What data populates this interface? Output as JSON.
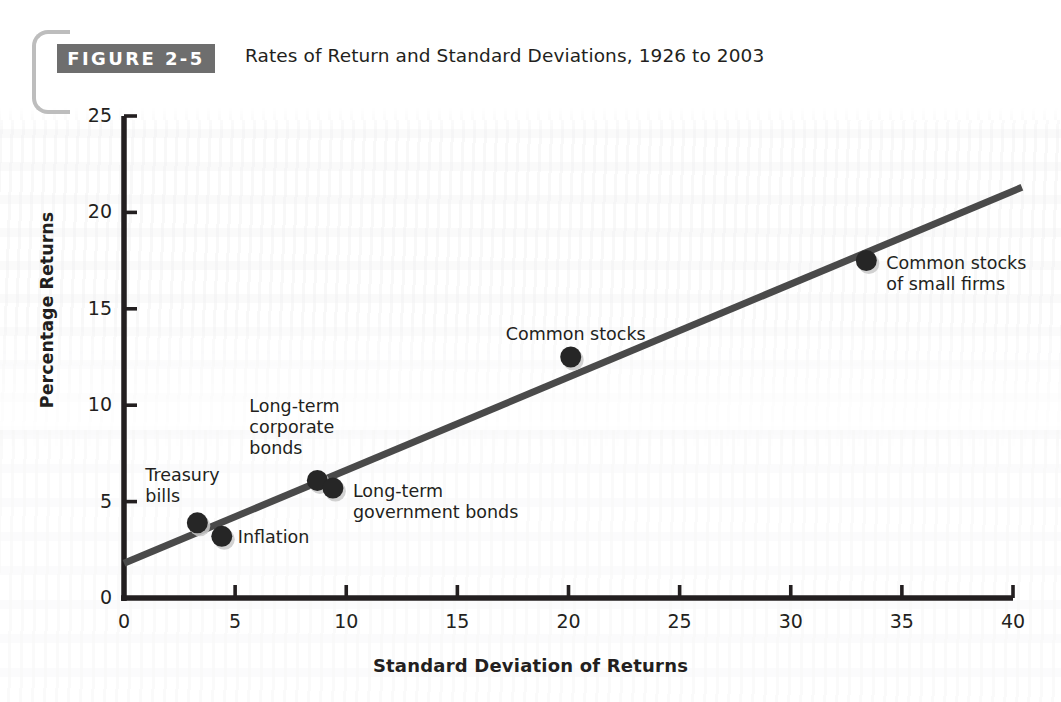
{
  "figure": {
    "badge": "FIGURE 2-5",
    "title": "Rates of Return and Standard Deviations, 1926 to 2003"
  },
  "colors": {
    "badge_background": "#6e6e6e",
    "badge_text": "#ffffff",
    "axis": "#231f20",
    "marker": "#262626",
    "trend_line": "#4a4a4a",
    "bracket": "#bdbdbd",
    "page_background": "#ffffff"
  },
  "chart_data": {
    "type": "scatter",
    "title": "Rates of Return and Standard Deviations, 1926 to 2003",
    "xlabel": "Standard Deviation of Returns",
    "ylabel": "Percentage Returns",
    "xlim": [
      0,
      40
    ],
    "ylim": [
      0,
      25
    ],
    "xticks": [
      0,
      5,
      10,
      15,
      20,
      25,
      30,
      35,
      40
    ],
    "yticks": [
      0,
      5,
      10,
      15,
      20,
      25
    ],
    "grid": false,
    "legend": "none",
    "points": [
      {
        "label": "Treasury\nbills",
        "x": 3.3,
        "y": 3.9,
        "label_dx": -52,
        "label_dy": -58
      },
      {
        "label": "Inflation",
        "x": 4.4,
        "y": 3.2,
        "label_dx": 16,
        "label_dy": -9
      },
      {
        "label": "Long-term\ncorporate\nbonds",
        "x": 8.7,
        "y": 6.1,
        "label_dx": -68,
        "label_dy": -84
      },
      {
        "label": "Long-term\ngovernment bonds",
        "x": 9.4,
        "y": 5.7,
        "label_dx": 20,
        "label_dy": -7
      },
      {
        "label": "Common stocks",
        "x": 20.1,
        "y": 12.5,
        "label_dx": -65,
        "label_dy": -33
      },
      {
        "label": "Common stocks\nof small firms",
        "x": 33.4,
        "y": 17.5,
        "label_dx": 20,
        "label_dy": -8
      }
    ],
    "trend_line": {
      "description": "straight fitted line rising left to right",
      "x_start": 0,
      "y_start": 1.8,
      "x_end": 40.4,
      "y_end": 21.3
    }
  },
  "axes": {
    "x": {
      "title": "Standard Deviation of Returns",
      "labels": [
        "0",
        "5",
        "10",
        "15",
        "20",
        "25",
        "30",
        "35",
        "40"
      ]
    },
    "y": {
      "title": "Percentage Returns",
      "labels": [
        "0",
        "5",
        "10",
        "15",
        "20",
        "25"
      ]
    }
  }
}
